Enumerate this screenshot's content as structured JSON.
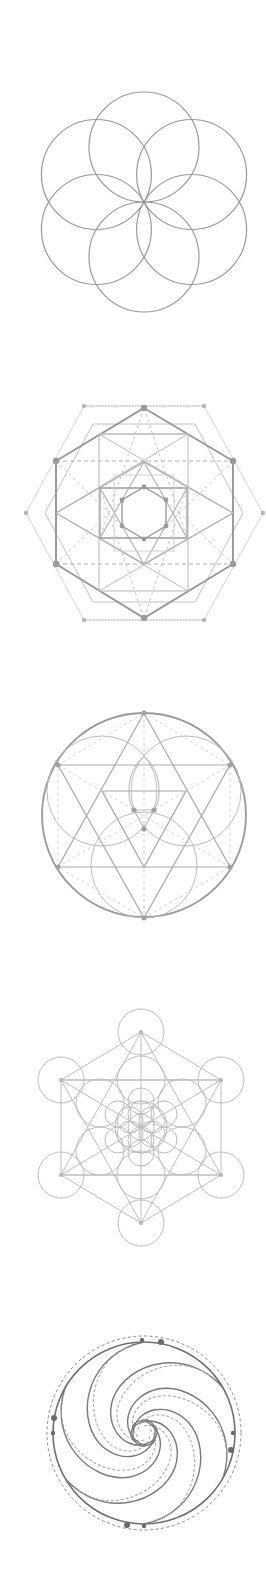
{
  "page": {
    "background": "#ffffff",
    "stroke_color": "#9a9a9a",
    "light_stroke": "#c4c4c4",
    "dark_stroke": "#6a6a6a"
  },
  "figures": [
    {
      "id": "seed-of-life",
      "label": "Seed of Life",
      "center": [
        144,
        202
      ],
      "circle_radius": 55,
      "circle_count": 6
    },
    {
      "id": "nested-hexagons",
      "label": "Nested hexagons and squares",
      "center": [
        144,
        513
      ]
    },
    {
      "id": "hexagram-in-circle",
      "label": "Hexagram in circle",
      "center": [
        144,
        815
      ],
      "radius": 102
    },
    {
      "id": "metatrons-cube",
      "label": "Metatron's Cube",
      "center": [
        141,
        1127
      ]
    },
    {
      "id": "golden-spiral-vortex",
      "label": "Spiral vortex in circle",
      "center": [
        144,
        1432
      ],
      "radius": 91
    }
  ]
}
